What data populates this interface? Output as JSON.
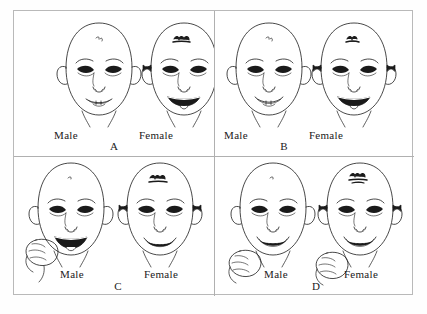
{
  "figure": {
    "background_color": "#ffffff",
    "frame_color": "#b9b9b9",
    "ink_color": "#1a1a1a",
    "panel_count": 4,
    "caption_partial": ""
  },
  "panels": [
    {
      "letter": "A",
      "male": {
        "label": "Male",
        "mouth": "small-closed-smile",
        "has_hair_curl": false,
        "has_bows": false,
        "has_hand": false
      },
      "female": {
        "label": "Female",
        "mouth": "wide-open-tongue",
        "has_hair_curl": true,
        "has_bows": true,
        "has_hand": false
      }
    },
    {
      "letter": "B",
      "male": {
        "label": "Male",
        "mouth": "small-closed-smile",
        "has_hair_curl": false,
        "has_bows": false,
        "has_hand": false
      },
      "female": {
        "label": "Female",
        "mouth": "wide-open-tongue",
        "has_hair_curl": true,
        "has_bows": true,
        "has_hand": false
      }
    },
    {
      "letter": "C",
      "male": {
        "label": "Male",
        "mouth": "wide-open-tongue",
        "has_hair_curl": false,
        "has_bows": false,
        "has_hand": true
      },
      "female": {
        "label": "Female",
        "mouth": "open-smile",
        "has_hair_curl": true,
        "has_bows": true,
        "has_hand": false
      }
    },
    {
      "letter": "D",
      "male": {
        "label": "Male",
        "mouth": "open-smile",
        "has_hair_curl": false,
        "has_bows": false,
        "has_hand": true
      },
      "female": {
        "label": "Female",
        "mouth": "open-smile",
        "has_hair_curl": true,
        "has_bows": true,
        "has_hand": true
      }
    }
  ]
}
